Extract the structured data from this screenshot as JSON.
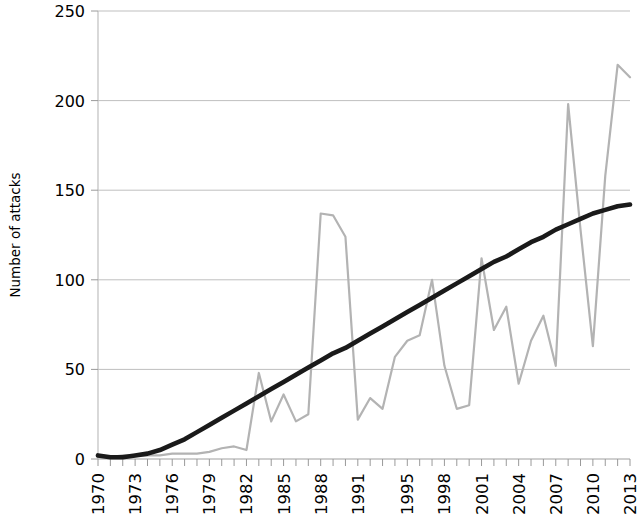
{
  "chart_data": {
    "type": "line",
    "title": "",
    "subtitle": "",
    "xlabel": "",
    "ylabel": "Number of attacks",
    "xlim": [
      1970,
      2013
    ],
    "ylim": [
      0,
      250
    ],
    "yticks": [
      0,
      50,
      100,
      150,
      200,
      250
    ],
    "ytick_labels": [
      "0",
      "50",
      "100",
      "150",
      "200",
      "250"
    ],
    "xtick_labels": [
      "1970",
      "1973",
      "1976",
      "1979",
      "1982",
      "1985",
      "1988",
      "1991",
      "1995",
      "1998",
      "2001",
      "2004",
      "2007",
      "2010",
      "2013"
    ],
    "xtick_years": [
      1970,
      1973,
      1976,
      1979,
      1982,
      1985,
      1988,
      1991,
      1995,
      1998,
      2001,
      2004,
      2007,
      2010,
      2013
    ],
    "grid": "horizontal",
    "legend": "none",
    "x": [
      1970,
      1971,
      1972,
      1973,
      1974,
      1975,
      1976,
      1977,
      1978,
      1979,
      1980,
      1981,
      1982,
      1983,
      1984,
      1985,
      1986,
      1987,
      1988,
      1989,
      1990,
      1991,
      1992,
      1993,
      1994,
      1995,
      1996,
      1997,
      1998,
      1999,
      2000,
      2001,
      2002,
      2003,
      2004,
      2005,
      2006,
      2007,
      2008,
      2009,
      2010,
      2011,
      2012,
      2013
    ],
    "series": [
      {
        "name": "Number of attacks",
        "color": "#b3b3b3",
        "style": "thin-gray-line",
        "values": [
          1,
          1,
          2,
          2,
          2,
          2,
          3,
          3,
          3,
          4,
          6,
          7,
          5,
          48,
          21,
          36,
          21,
          25,
          137,
          136,
          124,
          22,
          34,
          28,
          57,
          66,
          69,
          100,
          52,
          28,
          30,
          112,
          72,
          85,
          42,
          66,
          80,
          52,
          198,
          128,
          63,
          158,
          220,
          213
        ]
      },
      {
        "name": "Trend (polynomial fit)",
        "color": "#1a1a1a",
        "style": "thick-black-trend",
        "values": [
          2,
          1,
          1,
          2,
          3,
          5,
          8,
          11,
          15,
          19,
          23,
          27,
          31,
          35,
          39,
          43,
          47,
          51,
          55,
          59,
          62,
          66,
          70,
          74,
          78,
          82,
          86,
          90,
          94,
          98,
          102,
          106,
          110,
          113,
          117,
          121,
          124,
          128,
          131,
          134,
          137,
          139,
          141,
          142
        ]
      }
    ]
  },
  "axis": {
    "ylabel": "Number of attacks"
  }
}
